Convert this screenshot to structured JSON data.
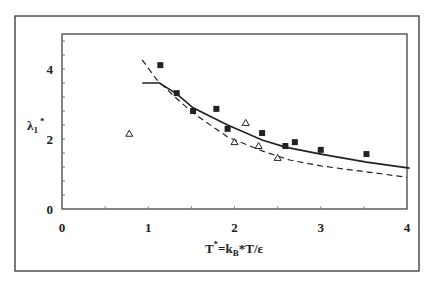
{
  "chart_data": {
    "type": "line",
    "title": "",
    "xlabel": "T*=kB*T/ε",
    "ylabel": "λ1*",
    "xlim": [
      0,
      4
    ],
    "ylim": [
      0,
      5
    ],
    "x_ticks": [
      "0",
      "1",
      "2",
      "3",
      "4"
    ],
    "y_ticks": [
      "0",
      "2",
      "4"
    ],
    "grid": false,
    "legend": null,
    "series": [
      {
        "name": "solid-curve",
        "style": "solid",
        "points": [
          [
            0.93,
            3.6
          ],
          [
            1.13,
            3.6
          ],
          [
            1.33,
            3.29
          ],
          [
            1.52,
            2.89
          ],
          [
            1.92,
            2.4
          ],
          [
            2.32,
            1.97
          ],
          [
            2.59,
            1.77
          ],
          [
            3.0,
            1.57
          ],
          [
            3.53,
            1.34
          ],
          [
            4.03,
            1.17
          ]
        ]
      },
      {
        "name": "dashed-curve",
        "style": "dashed",
        "points": [
          [
            0.93,
            4.26
          ],
          [
            1.1,
            3.69
          ],
          [
            1.31,
            3.2
          ],
          [
            1.52,
            2.74
          ],
          [
            1.92,
            2.06
          ],
          [
            2.32,
            1.66
          ],
          [
            2.64,
            1.4
          ],
          [
            3.0,
            1.23
          ],
          [
            3.53,
            1.06
          ],
          [
            4.0,
            0.91
          ]
        ]
      },
      {
        "name": "filled-squares",
        "style": "marker-square",
        "points": [
          [
            1.14,
            4.11
          ],
          [
            1.33,
            3.31
          ],
          [
            1.52,
            2.8
          ],
          [
            1.79,
            2.86
          ],
          [
            1.92,
            2.29
          ],
          [
            2.32,
            2.17
          ],
          [
            2.59,
            1.8
          ],
          [
            2.7,
            1.91
          ],
          [
            3.0,
            1.69
          ],
          [
            3.53,
            1.57
          ]
        ]
      },
      {
        "name": "open-triangles",
        "style": "marker-triangle",
        "points": [
          [
            0.78,
            2.15
          ],
          [
            2.0,
            1.91
          ],
          [
            2.13,
            2.46
          ],
          [
            2.28,
            1.8
          ],
          [
            2.5,
            1.46
          ]
        ]
      }
    ]
  },
  "labels": {
    "x_title_main": "T",
    "x_title_sup": "*",
    "x_title_eq": "=k",
    "x_title_sub": "B",
    "x_title_rest": "*T/ε",
    "y_title_main": "λ",
    "y_title_sub": "1",
    "y_title_sup": "*"
  },
  "colors": {
    "ink": "#222222",
    "frame": "#333333",
    "background": "#ffffff"
  }
}
